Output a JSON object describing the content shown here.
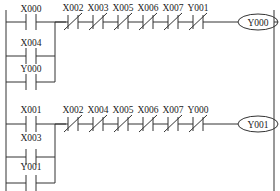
{
  "diagram_type": "PLC ladder diagram",
  "colors": {
    "line": "#333333",
    "text": "#222222",
    "background": "#ffffff"
  },
  "rungs": [
    {
      "output_coil": "Y000",
      "parallel_inputs": [
        {
          "label": "X000",
          "type": "normally-open"
        },
        {
          "label": "X004",
          "type": "normally-open"
        },
        {
          "label": "Y000",
          "type": "normally-open"
        }
      ],
      "series_contacts": [
        {
          "label": "X002",
          "type": "normally-closed"
        },
        {
          "label": "X003",
          "type": "normally-closed"
        },
        {
          "label": "X005",
          "type": "normally-closed"
        },
        {
          "label": "X006",
          "type": "normally-closed"
        },
        {
          "label": "X007",
          "type": "normally-closed"
        },
        {
          "label": "Y001",
          "type": "normally-closed"
        }
      ]
    },
    {
      "output_coil": "Y001",
      "parallel_inputs": [
        {
          "label": "X001",
          "type": "normally-open"
        },
        {
          "label": "X003",
          "type": "normally-open"
        },
        {
          "label": "Y001",
          "type": "normally-open"
        }
      ],
      "series_contacts": [
        {
          "label": "X002",
          "type": "normally-closed"
        },
        {
          "label": "X004",
          "type": "normally-closed"
        },
        {
          "label": "X005",
          "type": "normally-closed"
        },
        {
          "label": "X006",
          "type": "normally-closed"
        },
        {
          "label": "X007",
          "type": "normally-closed"
        },
        {
          "label": "Y000",
          "type": "normally-closed"
        }
      ]
    }
  ]
}
